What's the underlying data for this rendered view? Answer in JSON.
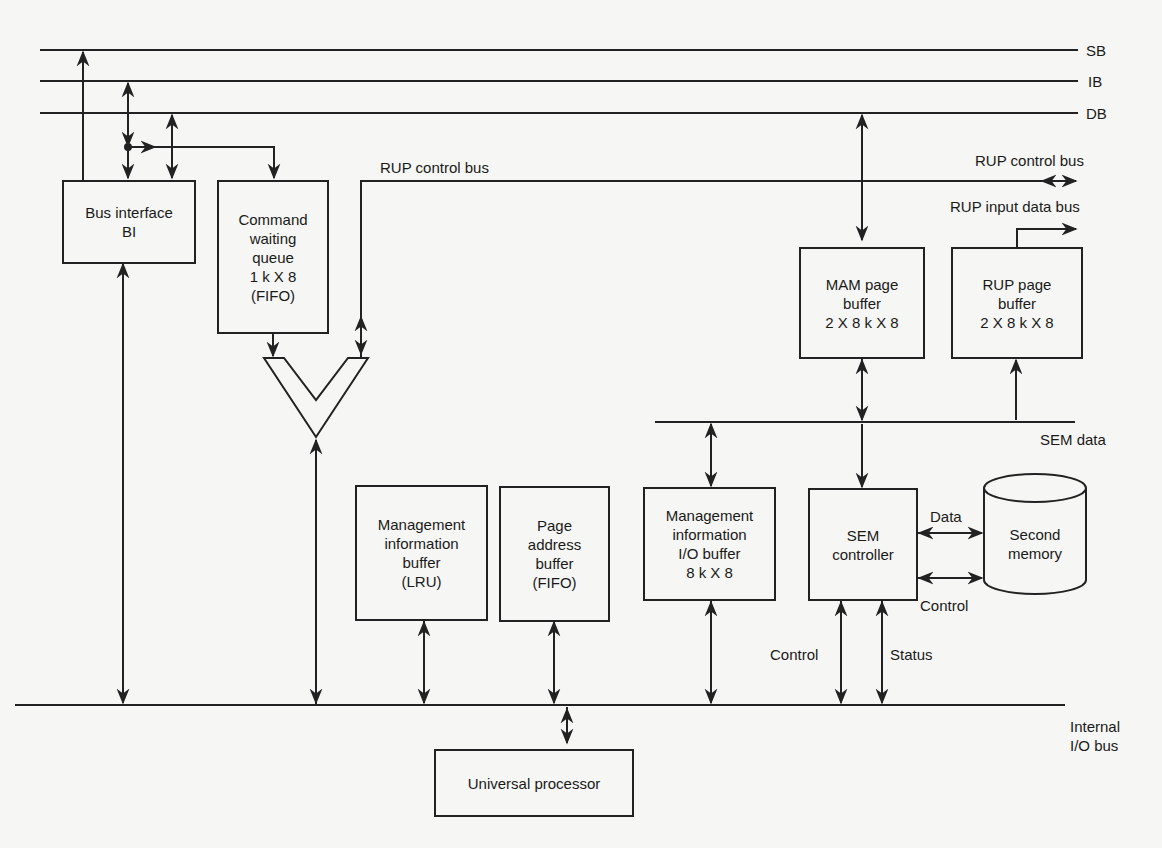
{
  "buses": {
    "sb": "SB",
    "ib": "IB",
    "db": "DB",
    "rup_control_bus_left": "RUP control bus",
    "rup_control_bus_right": "RUP control bus",
    "rup_input_data_bus": "RUP input data bus",
    "sem_data": "SEM data",
    "internal_io_bus": [
      "Internal",
      "I/O bus"
    ]
  },
  "blocks": {
    "bus_interface": [
      "Bus interface",
      "BI"
    ],
    "command_queue": [
      "Command",
      "waiting",
      "queue",
      "1 k X 8",
      "(FIFO)"
    ],
    "mam_page_buffer": [
      "MAM page",
      "buffer",
      "2 X 8 k X 8"
    ],
    "rup_page_buffer": [
      "RUP page",
      "buffer",
      "2 X 8 k X 8"
    ],
    "mgmt_info_buffer": [
      "Management",
      "information",
      "buffer",
      "(LRU)"
    ],
    "page_address_buffer": [
      "Page",
      "address",
      "buffer",
      "(FIFO)"
    ],
    "mgmt_io_buffer": [
      "Management",
      "information",
      "I/O buffer",
      "8 k X 8"
    ],
    "sem_controller": [
      "SEM",
      "controller"
    ],
    "second_memory": [
      "Second",
      "memory"
    ],
    "universal_processor": [
      "Universal processor"
    ]
  },
  "signals": {
    "data": "Data",
    "control_right": "Control",
    "control_left": "Control",
    "status": "Status"
  },
  "colors": {
    "line": "#222222",
    "background": "#f6f6f4"
  }
}
